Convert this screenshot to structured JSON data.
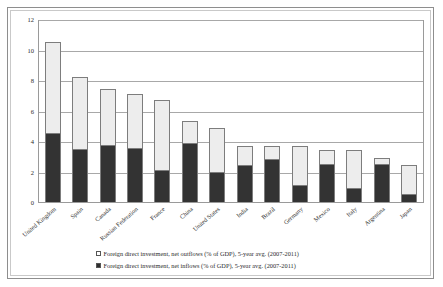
{
  "chart_data": {
    "type": "bar",
    "subtype": "stacked-vertical",
    "title": "",
    "xlabel": "",
    "ylabel": "",
    "ylim": [
      0,
      12
    ],
    "ytick_step": 2,
    "yticks": [
      0,
      2,
      4,
      6,
      8,
      10,
      12
    ],
    "ytick_labels": [
      "0",
      "2",
      "4",
      "6",
      "8",
      "10",
      "12"
    ],
    "grid": true,
    "grid_axis": "y",
    "legend_position": "bottom",
    "categories": [
      "United Kingdom",
      "Spain",
      "Canada",
      "Russian Federation",
      "France",
      "China",
      "United States",
      "India",
      "Brazil",
      "Germany",
      "Mexico",
      "Italy",
      "Argentina",
      "Japan"
    ],
    "series": [
      {
        "name": "Foreign direct investment, net inflows (% of GDP), 5-year avg. (2007-2011)",
        "short_name": "net inflows",
        "color": "#333333",
        "stack_order": "bottom",
        "values": [
          4.5,
          3.5,
          3.75,
          3.55,
          2.1,
          3.9,
          2.0,
          2.4,
          2.85,
          1.1,
          2.5,
          0.95,
          2.5,
          0.5
        ]
      },
      {
        "name": "Foreign direct investment, net outflows (% of GDP), 5-year avg. (2007-2011)",
        "short_name": "net outflows",
        "color": "#ededed",
        "stack_order": "top",
        "values": [
          5.9,
          4.6,
          3.6,
          3.45,
          4.5,
          1.35,
          2.8,
          1.2,
          0.75,
          2.5,
          0.85,
          2.4,
          0.35,
          1.85
        ]
      }
    ],
    "totals": [
      10.4,
      8.1,
      7.35,
      7.0,
      6.6,
      5.25,
      4.8,
      3.6,
      3.6,
      3.6,
      3.35,
      3.35,
      2.85,
      2.35
    ]
  },
  "legend": {
    "items": [
      {
        "swatch": "outflow",
        "label": "Foreign direct investment, net outflows (% of GDP), 5-year avg. (2007-2011)"
      },
      {
        "swatch": "inflow",
        "label": "Foreign direct investment, net inflows (% of GDP), 5-year avg. (2007-2011)"
      }
    ]
  },
  "colors": {
    "outflow_fill": "#ededed",
    "inflow_fill": "#333333",
    "bar_border": "#7d7d7d",
    "gridline": "#a8a8a8",
    "axis": "#9a9a9a",
    "frame_outer": "#8e8e8e",
    "frame_inner": "#c9c9c9",
    "text": "#2b2b2b"
  }
}
